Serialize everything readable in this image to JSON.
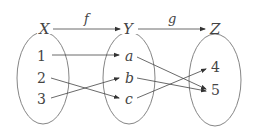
{
  "diagram": {
    "type": "function-mapping",
    "sets": [
      {
        "name": "X",
        "elements": [
          "1",
          "2",
          "3"
        ]
      },
      {
        "name": "Y",
        "elements": [
          "a",
          "b",
          "c"
        ]
      },
      {
        "name": "Z",
        "elements": [
          "4",
          "5"
        ]
      }
    ],
    "functions": [
      {
        "name": "f",
        "from": "X",
        "to": "Y",
        "mapping": [
          {
            "from": "1",
            "to": "a"
          },
          {
            "from": "2",
            "to": "c"
          },
          {
            "from": "3",
            "to": "b"
          }
        ]
      },
      {
        "name": "g",
        "from": "Y",
        "to": "Z",
        "mapping": [
          {
            "from": "a",
            "to": "5"
          },
          {
            "from": "b",
            "to": "5"
          },
          {
            "from": "c",
            "to": "4"
          }
        ]
      }
    ]
  },
  "labels": {
    "X": "X",
    "Y": "Y",
    "Z": "Z",
    "f": "f",
    "g": "g",
    "x1": "1",
    "x2": "2",
    "x3": "3",
    "ya": "a",
    "yb": "b",
    "yc": "c",
    "z4": "4",
    "z5": "5"
  },
  "colors": {
    "stroke": "#444444",
    "ellipse": "#777777",
    "background": "#ffffff"
  }
}
